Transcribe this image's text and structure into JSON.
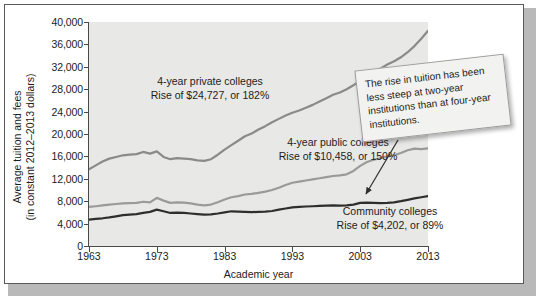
{
  "figure": {
    "background": "#ffffff",
    "plot_background": "#e8e8e6",
    "frame_color": "#5a5a5a"
  },
  "callout": {
    "text": "The rise in tuition has been less steep at two-year institutions than at four-year institutions."
  },
  "chart_data": {
    "type": "line",
    "title": "",
    "xlabel": "Academic year",
    "ylabel": "Average tuition and fees (in constant 2012–2013 dollars)",
    "ylabel_line1": "Average tuition and fees",
    "ylabel_line2": "(in constant 2012–2013 dollars)",
    "xlim": [
      1963,
      2013
    ],
    "ylim": [
      0,
      40000
    ],
    "grid": false,
    "legend_position": "inline-annotations",
    "yticks": [
      0,
      4000,
      8000,
      12000,
      16000,
      20000,
      24000,
      28000,
      32000,
      36000,
      40000
    ],
    "ytick_labels": [
      "0",
      "4,000",
      "8,000",
      "12,000",
      "16,000",
      "20,000",
      "24,000",
      "28,000",
      "32,000",
      "36,000",
      "40,000"
    ],
    "xticks": [
      1963,
      1973,
      1983,
      1993,
      2003,
      2013
    ],
    "xtick_labels": [
      "1963",
      "1973",
      "1983",
      "1993",
      "2003",
      "2013"
    ],
    "x": [
      1963,
      1964,
      1965,
      1966,
      1967,
      1968,
      1969,
      1970,
      1971,
      1972,
      1973,
      1974,
      1975,
      1976,
      1977,
      1978,
      1979,
      1980,
      1981,
      1982,
      1983,
      1984,
      1985,
      1986,
      1987,
      1988,
      1989,
      1990,
      1991,
      1992,
      1993,
      1994,
      1995,
      1996,
      1997,
      1998,
      1999,
      2000,
      2001,
      2002,
      2003,
      2004,
      2005,
      2006,
      2007,
      2008,
      2009,
      2010,
      2011,
      2012,
      2013
    ],
    "series": [
      {
        "name": "4-year private colleges",
        "color": "#8a8a8a",
        "label_line1": "4-year private colleges",
        "label_line2": "Rise of $24,727, or 182%",
        "rise_dollars": 24727,
        "rise_percent": 182,
        "values": [
          13700,
          14400,
          15100,
          15600,
          15900,
          16200,
          16300,
          16400,
          16800,
          16500,
          16900,
          15900,
          15500,
          15700,
          15600,
          15500,
          15300,
          15200,
          15500,
          16300,
          17200,
          18000,
          18800,
          19600,
          20100,
          20800,
          21400,
          22100,
          22700,
          23300,
          23800,
          24200,
          24700,
          25200,
          25800,
          26400,
          27000,
          27400,
          28000,
          28700,
          29600,
          30400,
          31000,
          31700,
          32400,
          33000,
          33700,
          34600,
          35700,
          37000,
          38427
        ]
      },
      {
        "name": "4-year public colleges",
        "color": "#9a9a9a",
        "label_line1": "4-year public colleges",
        "label_line2": "Rise of $10,458, or 150%",
        "rise_dollars": 10458,
        "rise_percent": 150,
        "values": [
          6972,
          7100,
          7250,
          7400,
          7500,
          7600,
          7650,
          7700,
          7900,
          7800,
          8600,
          8100,
          7700,
          7800,
          7750,
          7600,
          7400,
          7250,
          7400,
          7800,
          8300,
          8700,
          8900,
          9200,
          9300,
          9500,
          9700,
          10000,
          10400,
          10900,
          11300,
          11500,
          11700,
          11900,
          12100,
          12300,
          12500,
          12600,
          12800,
          13400,
          14300,
          15000,
          15400,
          15700,
          16000,
          16200,
          16600,
          17100,
          17400,
          17300,
          17430
        ]
      },
      {
        "name": "Community colleges",
        "color": "#2e2e2e",
        "label_line1": "Community colleges",
        "label_line2": "Rise of $4,202, or 89%",
        "rise_dollars": 4202,
        "rise_percent": 89,
        "values": [
          4721,
          4850,
          4950,
          5100,
          5300,
          5500,
          5600,
          5700,
          5900,
          6100,
          6500,
          6200,
          5900,
          5950,
          5900,
          5800,
          5700,
          5600,
          5650,
          5800,
          6000,
          6200,
          6150,
          6100,
          6050,
          6100,
          6150,
          6250,
          6500,
          6700,
          6900,
          7000,
          7050,
          7100,
          7150,
          7200,
          7250,
          7200,
          7250,
          7400,
          7700,
          7750,
          7700,
          7650,
          7700,
          7800,
          8000,
          8250,
          8500,
          8700,
          8923
        ]
      }
    ]
  }
}
